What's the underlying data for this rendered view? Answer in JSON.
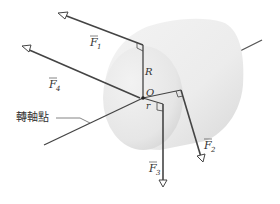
{
  "diagram": {
    "labels": {
      "F1": "F",
      "F1_sub": "1",
      "F2": "F",
      "F2_sub": "2",
      "F3": "F",
      "F3_sub": "3",
      "F4": "F",
      "F4_sub": "4",
      "R": "R",
      "r": "r",
      "O": "O",
      "pivot": "轉軸點"
    },
    "colors": {
      "line": "#4a4a4a",
      "cylinder_light": "#f4f4f4",
      "cylinder_dark": "#d9d9d9",
      "text": "#333333"
    }
  }
}
